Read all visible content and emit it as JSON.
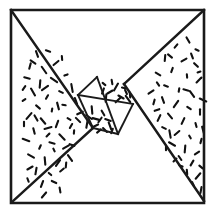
{
  "figure": {
    "description": "Square frame containing a rotated square divided into a two by two grid of small squares, flanked by two stippled right triangles",
    "background_color": "#ffffff",
    "ink_color": "#1a1a1a",
    "stipple_color": "#111111"
  },
  "canvas": {
    "width": 215,
    "height": 214
  },
  "outer_frame": {
    "name": "outer-square",
    "points": "11,10 204,10 204,203 11,203",
    "stroke_width": 2.6
  },
  "regions": [
    {
      "id": "left-triangle",
      "label": "Left stippled triangle",
      "shaded": true,
      "points": "11,10 93,128 13,201",
      "stroke_width": 2.4
    },
    {
      "id": "right-triangle",
      "label": "Right stippled triangle",
      "shaded": true,
      "points": "204,10 204,201 124,84",
      "stroke_width": 2.4
    },
    {
      "id": "upper-left-blank-triangle",
      "label": "Upper blank triangle",
      "shaded": false,
      "points": "11,10 204,10 97,77",
      "stroke_width": 2.4
    },
    {
      "id": "lower-right-blank-triangle",
      "label": "Lower blank triangle",
      "shaded": false,
      "points": "13,201 204,201 118,134",
      "stroke_width": 2.4
    },
    {
      "id": "cell-top-left",
      "label": "Inner square cell upper left",
      "shaded": false,
      "points": "78,95 97,77 116,96 97,114",
      "stroke_width": 1.9
    },
    {
      "id": "cell-top-right",
      "label": "Inner square cell upper right",
      "shaded": true,
      "points": "97,77 124,84 133,104 116,96",
      "stroke_width": 1.9
    },
    {
      "id": "cell-bottom-left",
      "label": "Inner square cell lower left",
      "shaded": true,
      "points": "78,95 97,114 118,134 93,128",
      "stroke_width": 1.9
    },
    {
      "id": "cell-bottom-right",
      "label": "Inner square cell lower right",
      "shaded": false,
      "points": "97,114 116,96 133,104 118,134",
      "stroke_width": 1.9
    }
  ],
  "edges": [
    {
      "id": "edge-topleft-to-center",
      "from": [
        11,
        10
      ],
      "to": [
        93,
        128
      ],
      "weight": "major"
    },
    {
      "id": "edge-center-to-bottomleft",
      "from": [
        93,
        128
      ],
      "to": [
        13,
        201
      ],
      "weight": "major"
    },
    {
      "id": "edge-topright-to-center",
      "from": [
        204,
        10
      ],
      "to": [
        124,
        84
      ],
      "weight": "major"
    },
    {
      "id": "edge-center-to-bottomright",
      "from": [
        124,
        84
      ],
      "to": [
        204,
        201
      ],
      "weight": "major"
    },
    {
      "id": "edge-grid-upper-left-diag",
      "from": [
        97,
        77
      ],
      "to": [
        78,
        95
      ],
      "weight": "minor"
    },
    {
      "id": "edge-grid-left-diag",
      "from": [
        78,
        95
      ],
      "to": [
        93,
        128
      ],
      "weight": "minor"
    },
    {
      "id": "edge-grid-lower-diag",
      "from": [
        93,
        128
      ],
      "to": [
        118,
        134
      ],
      "weight": "minor"
    },
    {
      "id": "edge-grid-right-diag",
      "from": [
        118,
        134
      ],
      "to": [
        133,
        104
      ],
      "weight": "minor"
    },
    {
      "id": "edge-grid-mid-vertical",
      "from": [
        97,
        77
      ],
      "to": [
        118,
        134
      ],
      "weight": "minor"
    },
    {
      "id": "edge-grid-mid-horizontal",
      "from": [
        78,
        95
      ],
      "to": [
        133,
        104
      ],
      "weight": "minor"
    }
  ],
  "stipple": {
    "description": "Short randomly oriented dash marks filling the shaded regions",
    "mark_length_range": [
      3,
      8
    ],
    "mark_thickness": 2.1,
    "left_triangle_marks": [
      [
        37,
        54,
        70
      ],
      [
        48,
        51,
        20
      ],
      [
        30,
        66,
        105
      ],
      [
        44,
        70,
        55
      ],
      [
        56,
        63,
        140
      ],
      [
        27,
        78,
        15
      ],
      [
        40,
        84,
        95
      ],
      [
        54,
        80,
        35
      ],
      [
        66,
        75,
        160
      ],
      [
        33,
        92,
        60
      ],
      [
        47,
        97,
        120
      ],
      [
        61,
        92,
        25
      ],
      [
        72,
        88,
        80
      ],
      [
        24,
        100,
        145
      ],
      [
        38,
        107,
        40
      ],
      [
        52,
        110,
        100
      ],
      [
        64,
        105,
        10
      ],
      [
        76,
        101,
        70
      ],
      [
        29,
        116,
        130
      ],
      [
        43,
        121,
        50
      ],
      [
        57,
        124,
        110
      ],
      [
        69,
        119,
        30
      ],
      [
        80,
        113,
        155
      ],
      [
        34,
        131,
        75
      ],
      [
        48,
        135,
        135
      ],
      [
        62,
        137,
        45
      ],
      [
        74,
        132,
        95
      ],
      [
        26,
        140,
        20
      ],
      [
        40,
        147,
        115
      ],
      [
        54,
        150,
        65
      ],
      [
        66,
        147,
        150
      ],
      [
        31,
        156,
        30
      ],
      [
        45,
        161,
        85
      ],
      [
        58,
        163,
        125
      ],
      [
        70,
        158,
        55
      ],
      [
        36,
        171,
        100
      ],
      [
        50,
        174,
        40
      ],
      [
        62,
        170,
        140
      ],
      [
        28,
        180,
        70
      ],
      [
        42,
        184,
        110
      ],
      [
        54,
        182,
        25
      ],
      [
        24,
        124,
        90
      ],
      [
        58,
        106,
        75
      ],
      [
        71,
        126,
        120
      ],
      [
        45,
        88,
        145
      ],
      [
        33,
        62,
        35
      ],
      [
        62,
        58,
        85
      ],
      [
        52,
        143,
        15
      ],
      [
        36,
        118,
        60
      ],
      [
        66,
        165,
        95
      ],
      [
        24,
        88,
        125
      ],
      [
        48,
        128,
        165
      ],
      [
        78,
        120,
        45
      ],
      [
        60,
        190,
        80
      ],
      [
        44,
        195,
        130
      ],
      [
        30,
        168,
        150
      ],
      [
        72,
        145,
        20
      ]
    ],
    "right_triangle_marks": [
      [
        188,
        40,
        60
      ],
      [
        176,
        46,
        130
      ],
      [
        197,
        50,
        25
      ],
      [
        165,
        58,
        95
      ],
      [
        184,
        60,
        150
      ],
      [
        196,
        65,
        45
      ],
      [
        172,
        70,
        110
      ],
      [
        158,
        74,
        30
      ],
      [
        187,
        76,
        85
      ],
      [
        199,
        80,
        135
      ],
      [
        166,
        86,
        20
      ],
      [
        179,
        90,
        100
      ],
      [
        192,
        94,
        55
      ],
      [
        151,
        92,
        145
      ],
      [
        163,
        100,
        70
      ],
      [
        176,
        104,
        125
      ],
      [
        189,
        108,
        35
      ],
      [
        200,
        112,
        90
      ],
      [
        157,
        110,
        160
      ],
      [
        170,
        116,
        50
      ],
      [
        183,
        121,
        115
      ],
      [
        196,
        125,
        75
      ],
      [
        164,
        128,
        25
      ],
      [
        177,
        133,
        140
      ],
      [
        190,
        137,
        60
      ],
      [
        201,
        141,
        105
      ],
      [
        172,
        144,
        30
      ],
      [
        185,
        149,
        95
      ],
      [
        197,
        153,
        145
      ],
      [
        180,
        158,
        55
      ],
      [
        192,
        163,
        120
      ],
      [
        201,
        167,
        40
      ],
      [
        187,
        172,
        85
      ],
      [
        198,
        176,
        130
      ],
      [
        193,
        184,
        65
      ],
      [
        201,
        190,
        100
      ],
      [
        181,
        166,
        20
      ],
      [
        170,
        134,
        80
      ],
      [
        159,
        118,
        115
      ],
      [
        192,
        56,
        70
      ],
      [
        158,
        84,
        55
      ],
      [
        203,
        100,
        25
      ],
      [
        166,
        148,
        90
      ],
      [
        175,
        160,
        135
      ],
      [
        186,
        90,
        15
      ],
      [
        203,
        130,
        75
      ],
      [
        154,
        102,
        105
      ],
      [
        199,
        72,
        160
      ],
      [
        170,
        56,
        40
      ]
    ],
    "cell_top_right_marks": [
      [
        104,
        84,
        40
      ],
      [
        116,
        87,
        120
      ],
      [
        126,
        92,
        65
      ],
      [
        110,
        92,
        150
      ],
      [
        121,
        97,
        30
      ],
      [
        106,
        98,
        95
      ],
      [
        118,
        100,
        135
      ],
      [
        128,
        99,
        55
      ],
      [
        112,
        82,
        80
      ],
      [
        124,
        88,
        15
      ],
      [
        103,
        91,
        110
      ],
      [
        130,
        95,
        85
      ]
    ],
    "cell_bottom_left_marks": [
      [
        89,
        117,
        35
      ],
      [
        100,
        120,
        125
      ],
      [
        110,
        126,
        70
      ],
      [
        95,
        126,
        155
      ],
      [
        105,
        130,
        45
      ],
      [
        87,
        124,
        100
      ],
      [
        99,
        131,
        140
      ],
      [
        108,
        120,
        20
      ],
      [
        92,
        110,
        85
      ],
      [
        103,
        113,
        60
      ],
      [
        112,
        131,
        110
      ],
      [
        96,
        119,
        15
      ]
    ]
  }
}
